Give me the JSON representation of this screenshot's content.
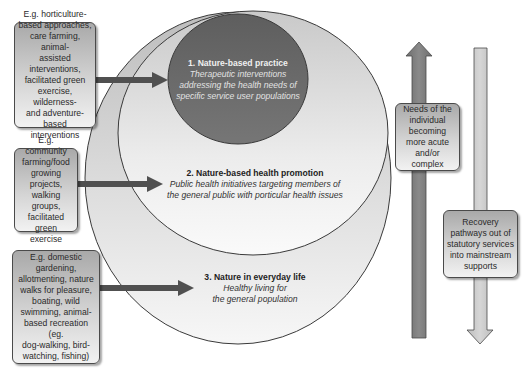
{
  "colors": {
    "outer_circle": "#d0d0d0",
    "middle_circle": "#e6e6e6",
    "inner_circle": "#6a6a6a",
    "stroke": "#3a3a3a",
    "arrow_dark": "#555555",
    "up_arrow": "#808080",
    "down_arrow": "#c8c8c8"
  },
  "circles": [
    {
      "id": "inner",
      "title": "1. Nature-based practice",
      "description_lines": [
        "Therapeutic interventions",
        "addressing the health needs of",
        "specific service user populations"
      ]
    },
    {
      "id": "middle",
      "title": "2. Nature-based health promotion",
      "description_lines": [
        "Public health initiatives targeting members of",
        "the general public with porticular health issues"
      ]
    },
    {
      "id": "outer",
      "title": "3. Nature in everyday life",
      "description_lines": [
        "Healthy living for",
        "the general population"
      ]
    }
  ],
  "example_boxes": [
    {
      "lines": [
        "E.g. horticulture-",
        "based approaches,",
        "care farming, animal-",
        "assisted",
        "interventions,",
        "facilitated green",
        "exercise, wilderness-",
        "and adventure-based",
        "interventions"
      ]
    },
    {
      "lines": [
        "E.g. community",
        "farming/food",
        "growing",
        "projects,",
        "walking groups,",
        "facilitated",
        "green exercise"
      ]
    },
    {
      "lines": [
        "E.g. domestic",
        "gardening,",
        "allotmenting, nature",
        "walks for pleasure,",
        "boating, wild",
        "swimming, animal-",
        "based recreation (eg.",
        "dog-walking, bird-",
        "watching, fishing)"
      ]
    }
  ],
  "side_arrows": {
    "up": {
      "lines": [
        "Needs of the",
        "individual",
        "becoming",
        "more acute",
        "and/or complex"
      ]
    },
    "down": {
      "lines": [
        "Recovery",
        "pathways out of",
        "statutory services",
        "into mainstream",
        "supports"
      ]
    }
  }
}
